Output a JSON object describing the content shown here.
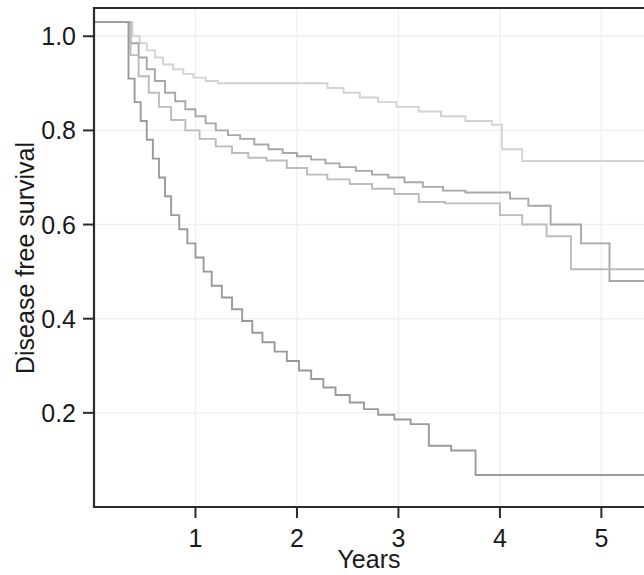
{
  "chart_data": {
    "type": "line",
    "title": "",
    "subtitle": "",
    "xlabel": "Years",
    "ylabel": "Disease free survival",
    "xlim": [
      0.0,
      5.42
    ],
    "ylim": [
      0.0,
      1.06
    ],
    "xticks": [
      1,
      2,
      3,
      4,
      5
    ],
    "xtick_labels": [
      "1",
      "2",
      "3",
      "4",
      "5"
    ],
    "yticks": [
      0.2,
      0.4,
      0.6,
      0.8,
      1.0
    ],
    "ytick_labels": [
      "0.2",
      "0.4",
      "0.6",
      "0.8",
      "1.0"
    ],
    "grid": true,
    "grid_color": "#f0f0f0",
    "legend_position": "none",
    "step_style": "post",
    "annotations": [],
    "series": [
      {
        "name": "Group 1",
        "color": "#d2d2d2",
        "description": "Highest disease free survival curve, plateaus near 0.735",
        "x": [
          0.0,
          0.3,
          0.38,
          0.45,
          0.52,
          0.6,
          0.68,
          0.78,
          0.88,
          0.98,
          1.1,
          1.22,
          1.34,
          1.48,
          1.62,
          1.78,
          2.02,
          2.3,
          2.46,
          2.62,
          2.8,
          2.98,
          3.2,
          3.42,
          3.66,
          3.92,
          4.02,
          4.22,
          5.42
        ],
        "y": [
          1.03,
          1.03,
          1.0,
          0.985,
          0.97,
          0.955,
          0.94,
          0.93,
          0.92,
          0.912,
          0.905,
          0.9,
          0.9,
          0.9,
          0.9,
          0.9,
          0.9,
          0.89,
          0.88,
          0.87,
          0.86,
          0.85,
          0.84,
          0.83,
          0.82,
          0.812,
          0.76,
          0.735,
          0.735
        ]
      },
      {
        "name": "Group 2",
        "color": "#a8a8a8",
        "description": "Second curve, declines steadily to about 0.48 at the right edge",
        "x": [
          0.0,
          0.3,
          0.36,
          0.44,
          0.52,
          0.6,
          0.7,
          0.8,
          0.9,
          1.0,
          1.1,
          1.2,
          1.32,
          1.44,
          1.58,
          1.72,
          1.86,
          2.0,
          2.14,
          2.28,
          2.42,
          2.58,
          2.74,
          2.9,
          3.06,
          3.24,
          3.44,
          3.66,
          3.9,
          4.1,
          4.28,
          4.5,
          4.8,
          5.08,
          5.42
        ],
        "y": [
          1.03,
          1.03,
          0.985,
          0.955,
          0.93,
          0.905,
          0.88,
          0.862,
          0.845,
          0.83,
          0.815,
          0.8,
          0.79,
          0.782,
          0.77,
          0.76,
          0.752,
          0.745,
          0.738,
          0.73,
          0.722,
          0.714,
          0.706,
          0.7,
          0.69,
          0.68,
          0.672,
          0.668,
          0.668,
          0.655,
          0.64,
          0.6,
          0.56,
          0.48,
          0.48
        ]
      },
      {
        "name": "Group 3",
        "color": "#bcbcbc",
        "description": "Third curve, converges with Group 2 near year 3 then ends near 0.505",
        "x": [
          0.0,
          0.3,
          0.36,
          0.44,
          0.54,
          0.64,
          0.76,
          0.9,
          1.04,
          1.2,
          1.36,
          1.52,
          1.7,
          1.9,
          2.1,
          2.3,
          2.52,
          2.74,
          2.96,
          3.2,
          3.46,
          3.72,
          4.0,
          4.22,
          4.46,
          4.7,
          5.42
        ],
        "y": [
          1.03,
          1.03,
          0.96,
          0.915,
          0.88,
          0.85,
          0.822,
          0.8,
          0.782,
          0.766,
          0.752,
          0.742,
          0.736,
          0.72,
          0.706,
          0.696,
          0.686,
          0.676,
          0.665,
          0.648,
          0.645,
          0.645,
          0.62,
          0.6,
          0.575,
          0.505,
          0.505
        ]
      },
      {
        "name": "Group 4",
        "color": "#9a9a9a",
        "description": "Lowest disease free survival curve, plateaus near 0.07",
        "x": [
          0.0,
          0.3,
          0.34,
          0.4,
          0.46,
          0.52,
          0.58,
          0.64,
          0.7,
          0.76,
          0.84,
          0.92,
          1.0,
          1.08,
          1.16,
          1.26,
          1.36,
          1.46,
          1.56,
          1.66,
          1.78,
          1.9,
          2.02,
          2.14,
          2.26,
          2.38,
          2.52,
          2.66,
          2.8,
          2.96,
          3.12,
          3.3,
          3.52,
          3.76,
          5.42
        ],
        "y": [
          1.03,
          1.03,
          0.91,
          0.86,
          0.82,
          0.78,
          0.74,
          0.7,
          0.66,
          0.62,
          0.59,
          0.56,
          0.53,
          0.5,
          0.47,
          0.445,
          0.42,
          0.395,
          0.37,
          0.35,
          0.33,
          0.31,
          0.29,
          0.272,
          0.254,
          0.238,
          0.222,
          0.208,
          0.196,
          0.186,
          0.176,
          0.13,
          0.12,
          0.068,
          0.068
        ]
      }
    ]
  },
  "axes": {
    "x_title": "Years",
    "y_title": "Disease free survival"
  }
}
